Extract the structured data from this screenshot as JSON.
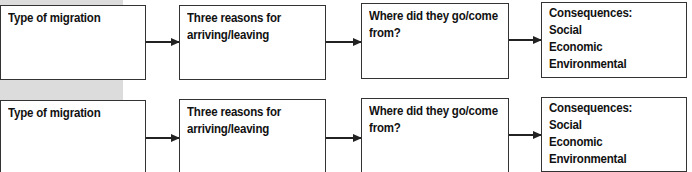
{
  "rows": [
    {
      "boxes": [
        {
          "lines": [
            "Type of migration"
          ]
        },
        {
          "lines": [
            "Three reasons for",
            "arriving/leaving"
          ]
        },
        {
          "lines": [
            "Where did they go/come",
            "from?"
          ]
        },
        {
          "lines": [
            "Consequences:",
            "Social",
            "Economic",
            "Environmental"
          ]
        }
      ]
    },
    {
      "boxes": [
        {
          "lines": [
            "Type of migration"
          ]
        },
        {
          "lines": [
            "Three reasons for",
            "arriving/leaving"
          ]
        },
        {
          "lines": [
            "Where did they go/come",
            "from?"
          ]
        },
        {
          "lines": [
            "Consequences:",
            "Social",
            "Economic",
            "Environmental"
          ]
        }
      ]
    }
  ],
  "colors": {
    "border": "#333333",
    "background_band": "#dcdcdc"
  }
}
